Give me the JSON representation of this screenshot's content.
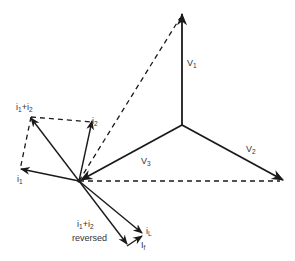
{
  "diagram": {
    "type": "phasor-diagram",
    "labels": {
      "v1": "V",
      "v1_sub": "1",
      "v2": "V",
      "v2_sub": "2",
      "v3": "V",
      "v3_sub": "3",
      "i1": "i",
      "i1_sub": "1",
      "i2": "i",
      "i2_sub": "2",
      "i1_plus_i2_a": "i",
      "i1_plus_i2_a_sub": "1",
      "i1_plus_i2_plus": "+i",
      "i1_plus_i2_b_sub": "2",
      "iL": "i",
      "iL_sub": "L",
      "if": "I",
      "if_sub": "f",
      "reversed_a": "i",
      "reversed_a_sub": "1",
      "reversed_plus": "+i",
      "reversed_b_sub": "2",
      "reversed_word": "reversed"
    },
    "colors": {
      "line": "#1a1a1a",
      "text": "#333333",
      "background": "#ffffff"
    }
  }
}
